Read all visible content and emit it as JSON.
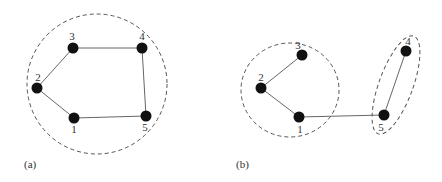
{
  "panels": [
    {
      "label": "(a)",
      "nodes": [
        {
          "id": "1",
          "x": 74,
          "y": 118,
          "lx": 74,
          "ly": 133
        },
        {
          "id": "2",
          "x": 37,
          "y": 88,
          "lx": 38,
          "ly": 81
        },
        {
          "id": "3",
          "x": 73,
          "y": 48,
          "lx": 72,
          "ly": 40
        },
        {
          "id": "4",
          "x": 142,
          "y": 48,
          "lx": 142,
          "ly": 40
        },
        {
          "id": "5",
          "x": 146,
          "y": 116,
          "lx": 145,
          "ly": 131
        }
      ],
      "edges": [
        [
          "3",
          "4"
        ],
        [
          "3",
          "2"
        ],
        [
          "2",
          "1"
        ],
        [
          "1",
          "5"
        ],
        [
          "4",
          "5"
        ]
      ],
      "clusters": [
        {
          "cx": 97,
          "cy": 84,
          "rx": 70,
          "ry": 70,
          "rot": 0
        }
      ]
    },
    {
      "label": "(b)",
      "nodes": [
        {
          "id": "1",
          "x": 299,
          "y": 117,
          "lx": 300,
          "ly": 133
        },
        {
          "id": "2",
          "x": 261,
          "y": 88,
          "lx": 261,
          "ly": 81
        },
        {
          "id": "3",
          "x": 302,
          "y": 55,
          "lx": 298,
          "ly": 49
        },
        {
          "id": "4",
          "x": 406,
          "y": 51,
          "lx": 408,
          "ly": 45
        },
        {
          "id": "5",
          "x": 384,
          "y": 115,
          "lx": 381,
          "ly": 131
        }
      ],
      "edges": [
        [
          "3",
          "2"
        ],
        [
          "2",
          "1"
        ],
        [
          "1",
          "5"
        ],
        [
          "5",
          "4"
        ]
      ],
      "clusters": [
        {
          "cx": 290,
          "cy": 90,
          "rx": 49,
          "ry": 47,
          "rot": 0
        },
        {
          "cx": 396,
          "cy": 85,
          "rx": 17,
          "ry": 52,
          "rot": 20
        }
      ]
    }
  ]
}
